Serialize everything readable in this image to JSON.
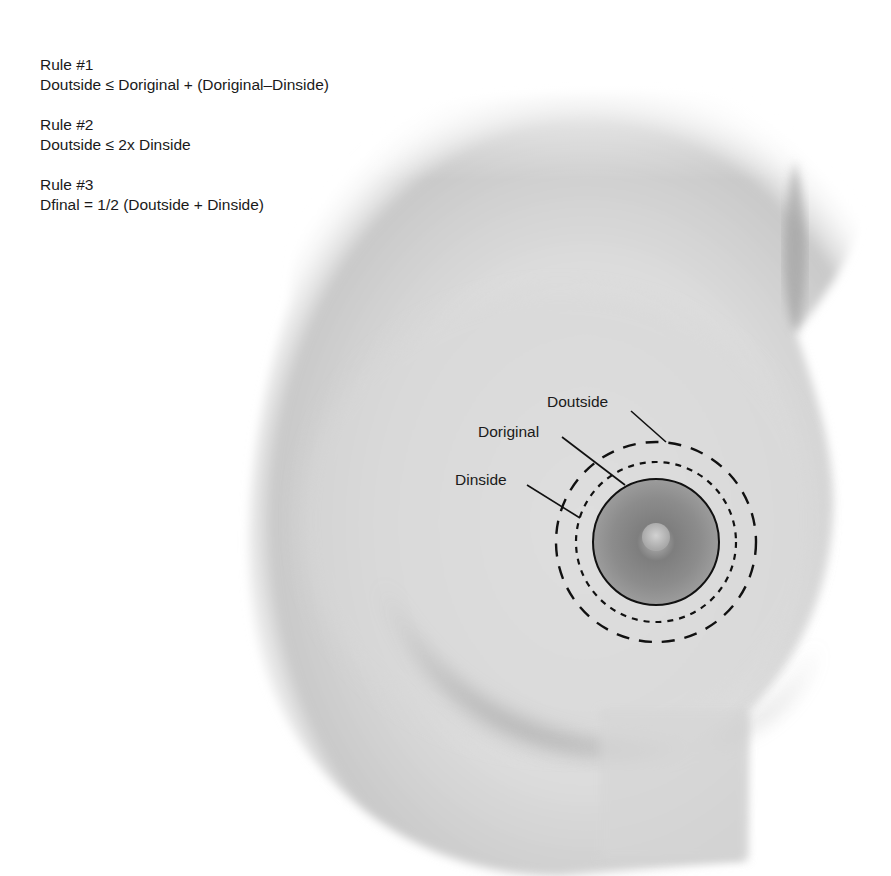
{
  "rules": [
    {
      "title": "Rule #1",
      "formula": "Doutside ≤ Doriginal + (Doriginal–Dinside)"
    },
    {
      "title": "Rule #2",
      "formula": "Doutside ≤ 2x Dinside"
    },
    {
      "title": "Rule #3",
      "formula": "Dfinal = 1/2 (Doutside + Dinside)"
    }
  ],
  "labels": {
    "outside": "Doutside",
    "original": "Doriginal",
    "inside": "Dinside"
  },
  "diagram": {
    "center": [
      656,
      542
    ],
    "radius_original": 63,
    "radius_inside_dashed": 80,
    "radius_outside_dashed": 100,
    "line_color": "#111111",
    "areola_color": "#8a8a8a"
  }
}
